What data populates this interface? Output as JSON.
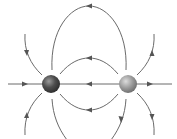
{
  "diagram": {
    "charges": [
      {
        "id": "left",
        "sign": "-",
        "cx": 51,
        "cy": 84,
        "r": 9,
        "color": "#4a4a4a"
      },
      {
        "id": "right",
        "sign": "+",
        "cx": 128,
        "cy": 84,
        "r": 9,
        "color": "#8a8a8a"
      }
    ],
    "line_color": "#6a6a6a",
    "arrow_color": "#555555",
    "field_lines": [
      {
        "name": "axis-left",
        "direction": "toward-left-charge"
      },
      {
        "name": "axis-middle",
        "direction": "right-to-left"
      },
      {
        "name": "axis-right",
        "direction": "away-from-right-charge"
      },
      {
        "name": "outer-top-loop",
        "direction": "right-to-left"
      },
      {
        "name": "inner-top-arc",
        "direction": "right-to-left"
      },
      {
        "name": "inner-bottom-arc",
        "direction": "right-to-left"
      },
      {
        "name": "outer-bottom-loop",
        "direction": "right-to-left"
      },
      {
        "name": "left-upper",
        "direction": "inward"
      },
      {
        "name": "left-lower",
        "direction": "inward"
      },
      {
        "name": "right-upper",
        "direction": "outward"
      },
      {
        "name": "right-lower",
        "direction": "outward"
      }
    ]
  }
}
